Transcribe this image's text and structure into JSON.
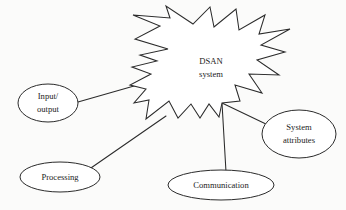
{
  "diagram": {
    "background_color": "#fbfbfa",
    "stroke_color": "#2b2b2b",
    "fill_color": "#ffffff",
    "center_node": {
      "id": "dsan-system",
      "shape": "starburst",
      "line_1": "DSAN",
      "line_2": "system",
      "cx": 211,
      "cy": 68
    },
    "nodes": [
      {
        "id": "input-output",
        "shape": "ellipse",
        "line_1": "Input/",
        "line_2": "output",
        "cx": 48,
        "cy": 103,
        "rx": 30,
        "ry": 19
      },
      {
        "id": "processing",
        "shape": "ellipse",
        "line_1": "Processing",
        "line_2": "",
        "cx": 60,
        "cy": 177,
        "rx": 40,
        "ry": 15
      },
      {
        "id": "communication",
        "shape": "ellipse",
        "line_1": "Communication",
        "line_2": "",
        "cx": 221,
        "cy": 185,
        "rx": 53,
        "ry": 15
      },
      {
        "id": "system-attributes",
        "shape": "ellipse",
        "line_1": "System",
        "line_2": "attributes",
        "cx": 299,
        "cy": 134,
        "rx": 37,
        "ry": 24
      }
    ],
    "connectors": [
      {
        "id": "input-output-to-dsan",
        "from": "input-output",
        "to": "dsan-system",
        "x1": 78,
        "y1": 102,
        "x2": 141,
        "y2": 84
      },
      {
        "id": "processing-to-dsan",
        "from": "processing",
        "to": "dsan-system",
        "x1": 88,
        "y1": 170,
        "x2": 166,
        "y2": 116
      },
      {
        "id": "communication-to-dsan",
        "from": "communication",
        "to": "dsan-system",
        "x1": 226,
        "y1": 172,
        "x2": 222,
        "y2": 103
      },
      {
        "id": "system-attributes-to-dsan",
        "from": "system-attributes",
        "to": "dsan-system",
        "x1": 222,
        "y1": 103,
        "x2": 268,
        "y2": 125
      }
    ]
  }
}
